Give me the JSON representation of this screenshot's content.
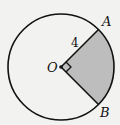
{
  "diagram": {
    "type": "circle-sector",
    "center_label": "O",
    "point_a_label": "A",
    "point_b_label": "B",
    "radius_label": "4",
    "angle": "right angle (90°)",
    "shaded_region": "sector AOB",
    "colors": {
      "background": "#f2f2f0",
      "stroke": "#111111",
      "shade": "#bdbdbd"
    }
  }
}
